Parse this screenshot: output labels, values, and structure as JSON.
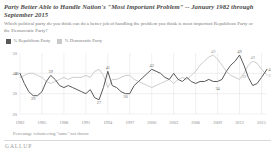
{
  "header": {
    "title": "Party Better Able to Handle Nation's \"Most Important Problem\" -- January 1982 through September 2015",
    "subtitle": "Which political party do you think can do a better job of handling the problem you think is most important Republican Party or the Democratic Party?"
  },
  "footer": {
    "footnote": "Percentage volunteering \"same\" not shown",
    "brand": "GALLUP"
  },
  "colors": {
    "republican": "#595959",
    "democrat": "#c9c9c9",
    "grid": "#d9d9d9",
    "text": "#7c7c7c",
    "title": "#4a4a4a"
  },
  "chart_data": {
    "type": "line",
    "title": "Party Better Able to Handle Nation's \"Most Important Problem\" -- January 1982 through September 2015",
    "xlabel": "",
    "ylabel": "",
    "ylim": [
      20,
      50
    ],
    "yticks": [
      50,
      40,
      30,
      20
    ],
    "xlim": [
      1982,
      2015.75
    ],
    "xticks": [
      1982,
      1985,
      1988,
      1991,
      1994,
      1997,
      2000,
      2003,
      2006,
      2009,
      2012,
      2015
    ],
    "xticklabels": [
      "1982",
      "1985",
      "1988",
      "1991",
      "1994",
      "1997",
      "2000",
      "2003",
      "2006",
      "2009",
      "2012",
      "2015"
    ],
    "grid": true,
    "legend_position": "top-left",
    "series": [
      {
        "name": "% Republican Party",
        "color": "#595959",
        "x": [
          1982.0,
          1982.6,
          1983.2,
          1983.8,
          1984.4,
          1985.0,
          1985.6,
          1986.2,
          1986.8,
          1987.4,
          1988.0,
          1988.6,
          1989.2,
          1989.8,
          1990.4,
          1991.0,
          1991.6,
          1992.2,
          1992.8,
          1993.4,
          1994.0,
          1994.6,
          1995.2,
          1995.8,
          1996.4,
          1997.0,
          1997.6,
          1998.2,
          1998.8,
          1999.4,
          2000.0,
          2000.6,
          2001.2,
          2001.8,
          2002.4,
          2003.0,
          2003.6,
          2004.2,
          2004.8,
          2005.4,
          2006.0,
          2006.6,
          2007.2,
          2007.8,
          2008.4,
          2009.0,
          2009.6,
          2010.2,
          2010.8,
          2011.4,
          2012.0,
          2012.6,
          2013.2,
          2013.8,
          2014.4,
          2015.0,
          2015.75
        ],
        "y": [
          40,
          35,
          31,
          29,
          29,
          31,
          36,
          39,
          37,
          34,
          33,
          34,
          33,
          32,
          31,
          30,
          32,
          28,
          27,
          33,
          41,
          34,
          33,
          31,
          30,
          30,
          34,
          36,
          38,
          40,
          42,
          41,
          40,
          38,
          37,
          40,
          37,
          36,
          38,
          36,
          35,
          36,
          36,
          37,
          36,
          36,
          37,
          41,
          44,
          46,
          49,
          44,
          38,
          34,
          35,
          38,
          42
        ],
        "labels": [
          {
            "x": 1982.0,
            "y": 40,
            "text": "40",
            "pos": "left"
          },
          {
            "x": 1983.8,
            "y": 29,
            "text": "29",
            "pos": "below"
          },
          {
            "x": 1986.2,
            "y": 39,
            "text": "39",
            "pos": "above"
          },
          {
            "x": 1992.8,
            "y": 27,
            "text": "27",
            "pos": "below"
          },
          {
            "x": 1994.0,
            "y": 41,
            "text": "41",
            "pos": "above"
          },
          {
            "x": 1996.4,
            "y": 30,
            "text": "30",
            "pos": "below"
          },
          {
            "x": 2000.0,
            "y": 42,
            "text": "42",
            "pos": "above"
          },
          {
            "x": 2009.0,
            "y": 34,
            "text": "34",
            "pos": "below"
          },
          {
            "x": 2012.0,
            "y": 49,
            "text": "49",
            "pos": "above"
          },
          {
            "x": 2015.75,
            "y": 42,
            "text": "42",
            "pos": "right"
          }
        ]
      },
      {
        "name": "% Democratic Party",
        "color": "#c9c9c9",
        "x": [
          1982.0,
          1982.6,
          1983.2,
          1983.8,
          1984.4,
          1985.0,
          1985.6,
          1986.2,
          1986.8,
          1987.4,
          1988.0,
          1988.6,
          1989.2,
          1989.8,
          1990.4,
          1991.0,
          1991.6,
          1992.2,
          1992.8,
          1993.4,
          1994.0,
          1994.6,
          1995.2,
          1995.8,
          1996.4,
          1997.0,
          1997.6,
          1998.2,
          1998.8,
          1999.4,
          2000.0,
          2000.6,
          2001.2,
          2001.8,
          2002.4,
          2003.0,
          2003.6,
          2004.2,
          2004.8,
          2005.4,
          2006.0,
          2006.6,
          2007.2,
          2007.8,
          2008.4,
          2009.0,
          2009.6,
          2010.2,
          2010.8,
          2011.4,
          2012.0,
          2012.6,
          2013.2,
          2013.8,
          2014.4,
          2015.0,
          2015.75
        ],
        "y": [
          38,
          39,
          40,
          40,
          39,
          38,
          36,
          35,
          36,
          37,
          38,
          37,
          38,
          38,
          38,
          39,
          38,
          41,
          42,
          39,
          33,
          37,
          37,
          38,
          39,
          39,
          37,
          36,
          35,
          34,
          33,
          34,
          35,
          36,
          37,
          35,
          37,
          38,
          37,
          39,
          41,
          44,
          46,
          48,
          49,
          47,
          44,
          41,
          39,
          38,
          37,
          40,
          44,
          46,
          45,
          42,
          39
        ],
        "labels": [
          {
            "x": 2008.4,
            "y": 49,
            "text": "49",
            "pos": "above"
          },
          {
            "x": 2013.8,
            "y": 46,
            "text": "49",
            "pos": "above"
          },
          {
            "x": 2012.6,
            "y": 40,
            "text": "39",
            "pos": "below"
          },
          {
            "x": 2015.75,
            "y": 39,
            "text": "37",
            "pos": "right"
          }
        ]
      }
    ]
  },
  "legend": {
    "items": [
      {
        "label": "% Republican Party",
        "color": "#595959",
        "name": "legend-republican"
      },
      {
        "label": "% Democratic Party",
        "color": "#c9c9c9",
        "name": "legend-democrat"
      }
    ]
  }
}
